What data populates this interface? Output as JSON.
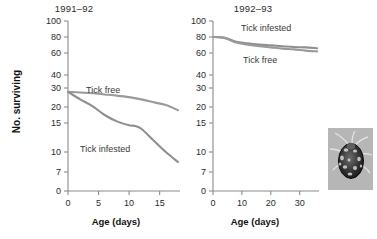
{
  "figure": {
    "ylabel": "No. surviving",
    "xlabel": "Age (days)",
    "line_color_tick_free": "#9a9a9a",
    "line_color_tick_infested": "#8f8f8f",
    "axis_color": "#8c8c8c"
  },
  "panels": [
    {
      "key": "left",
      "title": "1991–92",
      "xlabel": "Age (days)",
      "ylabel": "No. surviving",
      "xticks": [
        "0",
        "5",
        "10",
        "15"
      ],
      "yticks": [
        "100",
        "80",
        "60",
        "40",
        "30",
        "20",
        "15",
        "10",
        "7",
        "0"
      ],
      "series_labels": [
        "Tick free",
        "Tick infested"
      ]
    },
    {
      "key": "right",
      "title": "1992–93",
      "xlabel": "Age (days)",
      "ylabel": "No. surviving",
      "xticks": [
        "0",
        "10",
        "20",
        "30"
      ],
      "yticks": [
        "100",
        "80",
        "60",
        "40",
        "30",
        "20",
        "15",
        "10",
        "7",
        "0"
      ],
      "series_labels": [
        "Tick infested",
        "Tick free"
      ]
    }
  ],
  "inset": {
    "caption": "tick-photograph"
  },
  "chart_data": [
    {
      "type": "line",
      "title": "1991–92",
      "xlabel": "Age (days)",
      "ylabel": "No. surviving",
      "xlim": [
        0,
        18
      ],
      "ylim": [
        0,
        100
      ],
      "yscale": "log-like",
      "ytick_values": [
        100,
        80,
        60,
        40,
        30,
        20,
        15,
        10,
        7,
        0
      ],
      "xtick_values": [
        0,
        5,
        10,
        15
      ],
      "grid": false,
      "legend": "inline-annotation",
      "series": [
        {
          "name": "Tick free",
          "x": [
            0,
            2,
            4,
            6,
            8,
            10,
            12,
            14,
            16,
            18
          ],
          "values": [
            28,
            27.6,
            27.2,
            26.6,
            26,
            25.2,
            24,
            22.5,
            21,
            19
          ]
        },
        {
          "name": "Tick infested",
          "x": [
            0,
            2,
            4,
            6,
            8,
            10,
            11,
            12,
            14,
            16,
            18
          ],
          "values": [
            28,
            24,
            20.5,
            17.5,
            15.5,
            14.6,
            14.5,
            14,
            12,
            10,
            8.5
          ]
        }
      ]
    },
    {
      "type": "line",
      "title": "1992–93",
      "xlabel": "Age (days)",
      "ylabel": "No. surviving",
      "xlim": [
        0,
        36
      ],
      "ylim": [
        0,
        100
      ],
      "yscale": "log-like",
      "ytick_values": [
        100,
        80,
        60,
        40,
        30,
        20,
        15,
        10,
        7,
        0
      ],
      "xtick_values": [
        0,
        10,
        20,
        30
      ],
      "grid": false,
      "legend": "inline-annotation",
      "series": [
        {
          "name": "Tick infested",
          "x": [
            0,
            3,
            5,
            8,
            12,
            16,
            20,
            24,
            28,
            32,
            36
          ],
          "values": [
            80,
            79.5,
            78,
            74,
            72,
            70.5,
            69.5,
            68.5,
            67.5,
            67,
            66
          ]
        },
        {
          "name": "Tick free",
          "x": [
            0,
            3,
            5,
            8,
            12,
            16,
            20,
            24,
            28,
            32,
            36
          ],
          "values": [
            80,
            79.5,
            77.5,
            73,
            70.5,
            68.5,
            67,
            65.5,
            64.5,
            63,
            62
          ]
        }
      ]
    }
  ]
}
